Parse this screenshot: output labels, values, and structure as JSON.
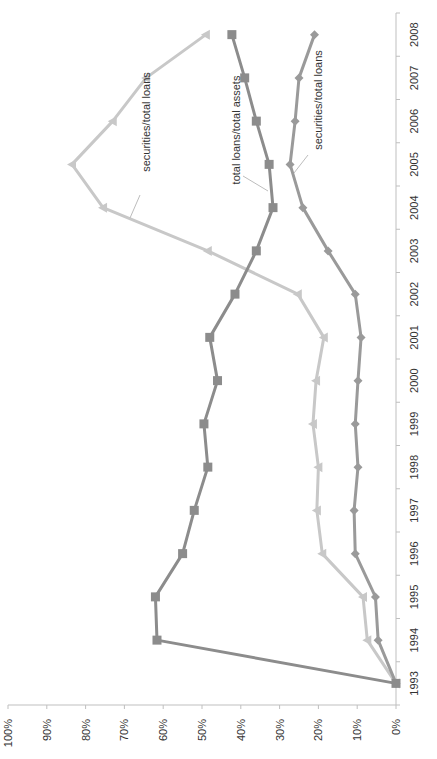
{
  "chart_data": {
    "type": "line",
    "orientation": "rotated 90 degrees clockwise (years run bottom-to-top along right edge, percent axis along bottom)",
    "title": "",
    "xlabel": "",
    "ylabel": "",
    "ylim": [
      0,
      100
    ],
    "y_ticks": [
      "0%",
      "10%",
      "20%",
      "30%",
      "40%",
      "50%",
      "60%",
      "70%",
      "80%",
      "90%",
      "100%"
    ],
    "grid": false,
    "legend": "none (inline callout labels)",
    "categories": [
      "1993",
      "1994",
      "1995",
      "1996",
      "1997",
      "1998",
      "1999",
      "2000",
      "2001",
      "2002",
      "2003",
      "2004",
      "2005",
      "2006",
      "2007",
      "2008"
    ],
    "series": [
      {
        "name": "total loans/total assets",
        "marker": "square",
        "color": "#8c8c8c",
        "values": [
          0,
          61.6,
          62,
          55,
          52,
          48.5,
          49.5,
          46,
          48,
          41.5,
          36,
          31.7,
          32.7,
          36,
          39,
          42.3
        ]
      },
      {
        "name": "securities/total loans",
        "marker": "triangle",
        "color": "#c8c8c8",
        "values": [
          0,
          7.4,
          8.5,
          19,
          20.4,
          20,
          21.4,
          20.6,
          18.6,
          25.3,
          48.5,
          75.5,
          83.5,
          73,
          64.4,
          49
        ]
      },
      {
        "name": "securities/total loans",
        "marker": "diamond",
        "color": "#9a9a9a",
        "values": [
          0,
          4.6,
          5.3,
          10.5,
          10.8,
          9.8,
          10.5,
          9.8,
          9,
          10.5,
          17.5,
          24,
          27.3,
          26,
          25,
          21
        ]
      }
    ],
    "annotations": [
      {
        "text": "securities/total loans",
        "series_index": 1,
        "at_category": "2004"
      },
      {
        "text": "total loans/total assets",
        "series_index": 0,
        "at_category": "2004"
      },
      {
        "text": "securities/total loans",
        "series_index": 2,
        "at_category": "2005"
      }
    ]
  }
}
